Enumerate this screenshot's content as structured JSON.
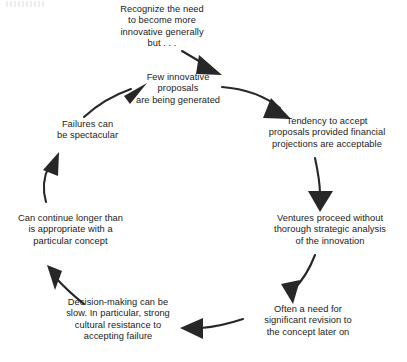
{
  "diagram": {
    "type": "cycle-flow-diagram",
    "direction": "clockwise",
    "background_color": "#ffffff",
    "text_color": "#1b1b1b",
    "arrow_color": "#272727",
    "nodes": [
      {
        "id": "recognize-need",
        "position": "top",
        "text": "Recognize the need\nto become more\ninnovative generally\nbut . . ."
      },
      {
        "id": "few-innovative-proposals",
        "position": "top-center",
        "text": "Few innovative\nproposals\nare being generated"
      },
      {
        "id": "tendency-to-accept",
        "position": "right-upper",
        "text": "Tendency to accept\nproposals provided financial\nprojections are acceptable"
      },
      {
        "id": "ventures-proceed",
        "position": "right-lower",
        "text": "Ventures proceed without\nthorough strategic analysis\nof the innovation"
      },
      {
        "id": "need-for-revision",
        "position": "bottom-right",
        "text": "Often a need for\nsignificant revision to\nthe concept later on"
      },
      {
        "id": "decision-making-slow",
        "position": "bottom-left",
        "text": "Decision-making can be\nslow.  In particular, strong\ncultural resistance to\naccepting failure"
      },
      {
        "id": "can-continue-longer",
        "position": "left-lower",
        "text": "Can continue longer than\nis appropriate with a\nparticular concept"
      },
      {
        "id": "failures-spectacular",
        "position": "left-upper",
        "text": "Failures can\nbe spectacular"
      }
    ],
    "arrows": [
      {
        "id": "arrow-recognize-to-proposals",
        "from": "recognize-need",
        "to": "few-innovative-proposals",
        "shape": "short-diagonal-down-right"
      },
      {
        "id": "arrow-proposals-to-tendency",
        "from": "few-innovative-proposals",
        "to": "tendency-to-accept",
        "shape": "curve-down-right"
      },
      {
        "id": "arrow-tendency-to-ventures",
        "from": "tendency-to-accept",
        "to": "ventures-proceed",
        "shape": "vertical-down"
      },
      {
        "id": "arrow-ventures-to-revision",
        "from": "ventures-proceed",
        "to": "need-for-revision",
        "shape": "diagonal-down-left"
      },
      {
        "id": "arrow-revision-to-decision",
        "from": "need-for-revision",
        "to": "decision-making-slow",
        "shape": "horizontal-left"
      },
      {
        "id": "arrow-decision-to-continue",
        "from": "decision-making-slow",
        "to": "can-continue-longer",
        "shape": "diagonal-up-left"
      },
      {
        "id": "arrow-continue-to-failures",
        "from": "can-continue-longer",
        "to": "failures-spectacular",
        "shape": "vertical-up"
      },
      {
        "id": "arrow-failures-to-proposals",
        "from": "failures-spectacular",
        "to": "few-innovative-proposals",
        "shape": "curve-up-right"
      }
    ]
  }
}
